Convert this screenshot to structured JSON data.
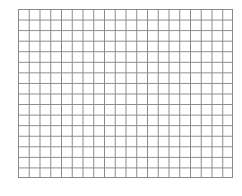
{
  "grid": {
    "columns": 20,
    "rows": 16,
    "line_color": "#8a8a8a",
    "background": "#ffffff"
  }
}
